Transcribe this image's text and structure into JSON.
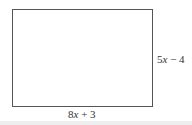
{
  "diagram": {
    "shape": "rectangle",
    "labels": {
      "bottom": {
        "coefficient": "8",
        "variable": "x",
        "rest": " + 3",
        "full": "8x + 3"
      },
      "right": {
        "coefficient": "5",
        "variable": "x",
        "rest": " − 4",
        "full": "5x − 4"
      }
    },
    "colors": {
      "stroke": "#555555",
      "text": "#333333",
      "background": "#ffffff"
    }
  }
}
